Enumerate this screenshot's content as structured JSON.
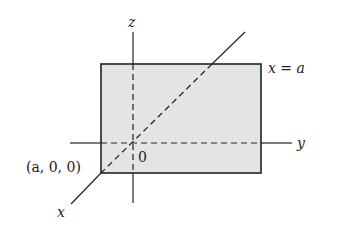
{
  "diagram": {
    "colors": {
      "plane_fill": "#e4e4e4",
      "stroke": "#222222",
      "background": "#ffffff"
    },
    "labels": {
      "z_axis": "z",
      "y_axis": "y",
      "x_axis": "x",
      "plane": "x = a",
      "origin": "0",
      "point": "(a, 0, 0)"
    },
    "axes": [
      {
        "name": "z",
        "style": "solid-outside-dashed-inside"
      },
      {
        "name": "y",
        "style": "solid-outside-dashed-inside"
      },
      {
        "name": "x",
        "style": "solid-outside-dashed-inside"
      }
    ],
    "plane": {
      "equation": "x = a",
      "shape": "rectangle"
    }
  }
}
